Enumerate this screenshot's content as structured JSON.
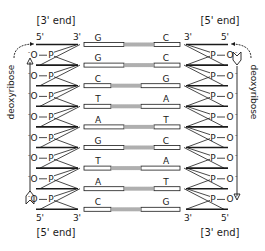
{
  "diagram": {
    "left_strand": {
      "top_end_label": "[3' end]",
      "bottom_end_label": "[5' end]",
      "top_prime_labels": [
        "5'",
        "3'"
      ],
      "bottom_prime_labels": [
        "5'",
        "3'"
      ],
      "backbone_label": "deoxyribose",
      "phosphate_label": "O",
      "phosphate_charge": "-",
      "phosphorus_label": "P",
      "direction": "up"
    },
    "right_strand": {
      "top_end_label": "[5' end]",
      "bottom_end_label": "[3' end]",
      "top_prime_labels": [
        "3'",
        "5'"
      ],
      "bottom_prime_labels": [
        "3'",
        "5'"
      ],
      "backbone_label": "deoxyribose",
      "phosphate_label": "O",
      "phosphate_charge": "-",
      "phosphorus_label": "P",
      "direction": "down"
    },
    "base_pairs": [
      {
        "left": "G",
        "right": "C",
        "bonds": 3
      },
      {
        "left": "G",
        "right": "C",
        "bonds": 3
      },
      {
        "left": "C",
        "right": "G",
        "bonds": 3
      },
      {
        "left": "T",
        "right": "A",
        "bonds": 2
      },
      {
        "left": "A",
        "right": "T",
        "bonds": 2
      },
      {
        "left": "G",
        "right": "C",
        "bonds": 3
      },
      {
        "left": "T",
        "right": "A",
        "bonds": 2
      },
      {
        "left": "A",
        "right": "T",
        "bonds": 2
      },
      {
        "left": "C",
        "right": "G",
        "bonds": 3
      }
    ],
    "colors": {
      "ink": "#1a1a1a",
      "background": "#ffffff"
    }
  }
}
